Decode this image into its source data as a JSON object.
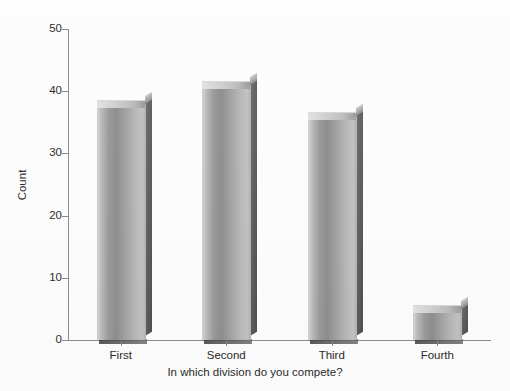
{
  "chart_data": {
    "type": "bar",
    "title": "",
    "subtitle": "",
    "categories": [
      "First",
      "Second",
      "Third",
      "Fourth"
    ],
    "values": [
      38,
      41,
      36,
      5
    ],
    "series": [
      {
        "name": "Count",
        "values": [
          38,
          41,
          36,
          5
        ]
      }
    ],
    "xlabel": "In which division do you compete?",
    "ylabel": "Count",
    "ylim": [
      0,
      50
    ],
    "yticks": [
      0,
      10,
      20,
      30,
      40,
      50
    ],
    "ytick_labels": [
      "0",
      "10",
      "20",
      "30",
      "40",
      "50"
    ],
    "grid": false,
    "legend": false,
    "legend_position": "none",
    "bar_style": "3d-cylinder",
    "bar_color": "#a8a8a8",
    "bar_shadow_color": "#4e4e4e",
    "axis_color": "#8a8a8a",
    "background_color": "#fdfdfd"
  },
  "axes": {
    "y_title": "Count",
    "x_title": "In which division do you compete?"
  }
}
